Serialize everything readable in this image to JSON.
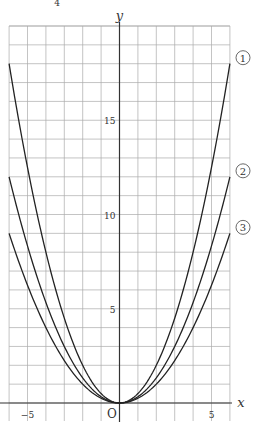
{
  "chart_data": {
    "type": "line",
    "title": "",
    "xlabel": "x",
    "ylabel": "y",
    "origin_label": "O",
    "xlim": [
      -6,
      6
    ],
    "ylim": [
      0,
      20
    ],
    "grid": true,
    "x_ticks": [
      {
        "value": -5,
        "label": "−5"
      },
      {
        "value": 5,
        "label": "5"
      }
    ],
    "y_ticks": [
      {
        "value": 5,
        "label": "5"
      },
      {
        "value": 10,
        "label": "10"
      },
      {
        "value": 15,
        "label": "15"
      }
    ],
    "series": [
      {
        "name": "①",
        "formula": "y = x^2/2",
        "coef": 0.5,
        "x": [
          -6,
          -5,
          -4,
          -3,
          -2,
          -1,
          0,
          1,
          2,
          3,
          4,
          5,
          6
        ],
        "values": [
          18,
          12.5,
          8,
          4.5,
          2,
          0.5,
          0,
          0.5,
          2,
          4.5,
          8,
          12.5,
          18
        ]
      },
      {
        "name": "②",
        "formula": "y = x^2/3",
        "coef": 0.3333,
        "x": [
          -6,
          -5,
          -4,
          -3,
          -2,
          -1,
          0,
          1,
          2,
          3,
          4,
          5,
          6
        ],
        "values": [
          12,
          8.33,
          5.33,
          3,
          1.33,
          0.33,
          0,
          0.33,
          1.33,
          3,
          5.33,
          8.33,
          12
        ]
      },
      {
        "name": "③",
        "formula": "y = x^2/4",
        "coef": 0.25,
        "x": [
          -6,
          -5,
          -4,
          -3,
          -2,
          -1,
          0,
          1,
          2,
          3,
          4,
          5,
          6
        ],
        "values": [
          9,
          6.25,
          4,
          2.25,
          1,
          0.25,
          0,
          0.25,
          1,
          2.25,
          4,
          6.25,
          9
        ]
      }
    ],
    "legend_position": "right end of each curve"
  },
  "top_fragment": "4"
}
